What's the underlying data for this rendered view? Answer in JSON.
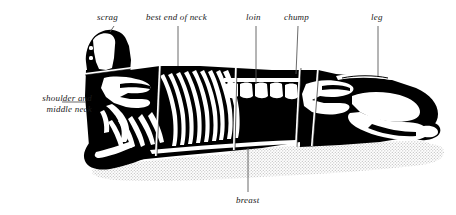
{
  "figure": {
    "title_visible": false,
    "colors": {
      "ink": "#000000",
      "paper": "#ffffff",
      "leader_line": "#555555",
      "shadow_stipple": "#c9c9c9",
      "label_text": "#1a1a1a"
    }
  },
  "labels": {
    "scrag": "scrag",
    "best_end_of_neck": "best end of neck",
    "loin": "loin",
    "chump": "chump",
    "leg": "leg",
    "shoulder_and_middle_neck_line1": "shoulder and",
    "shoulder_and_middle_neck_line2": "middle neck",
    "breast": "breast"
  },
  "cuts": [
    {
      "name": "scrag",
      "label": "scrag",
      "leader": "top"
    },
    {
      "name": "best end of neck",
      "label": "best end of neck",
      "leader": "top"
    },
    {
      "name": "loin",
      "label": "loin",
      "leader": "top"
    },
    {
      "name": "chump",
      "label": "chump",
      "leader": "top"
    },
    {
      "name": "leg",
      "label": "leg",
      "leader": "top"
    },
    {
      "name": "shoulder and middle neck",
      "label": "shoulder and middle neck",
      "leader": "left"
    },
    {
      "name": "breast",
      "label": "breast",
      "leader": "bottom"
    }
  ]
}
